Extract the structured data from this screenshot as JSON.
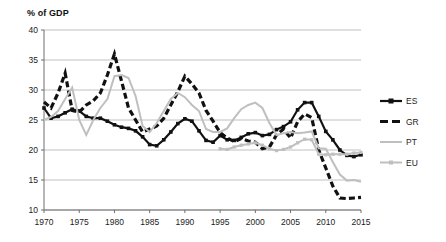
{
  "axis_title": "% of GDP",
  "legend": {
    "position": "right",
    "items": [
      {
        "key": "ES",
        "label": "ES",
        "color": "#111111",
        "style": "solid-marker"
      },
      {
        "key": "GR",
        "label": "GR",
        "color": "#111111",
        "style": "dashed"
      },
      {
        "key": "PT",
        "label": "PT",
        "color": "#bfbfbf",
        "style": "solid"
      },
      {
        "key": "EU",
        "label": "EU",
        "color": "#bfbfbf",
        "style": "solid-marker"
      }
    ]
  },
  "chart_data": {
    "type": "line",
    "title": "",
    "subtitle": "",
    "xlabel": "",
    "ylabel": "% of GDP",
    "xlim": [
      1970,
      2015
    ],
    "ylim": [
      10,
      40
    ],
    "ytick_step": 5,
    "xtick_step": 5,
    "xticks": [
      1970,
      1975,
      1980,
      1985,
      1990,
      1995,
      2000,
      2005,
      2010,
      2015
    ],
    "yticks": [
      10,
      15,
      20,
      25,
      30,
      35,
      40
    ],
    "grid": "horizontal",
    "legend_position": "right",
    "x": [
      1970,
      1971,
      1972,
      1973,
      1974,
      1975,
      1976,
      1977,
      1978,
      1979,
      1980,
      1981,
      1982,
      1983,
      1984,
      1985,
      1986,
      1987,
      1988,
      1989,
      1990,
      1991,
      1992,
      1993,
      1994,
      1995,
      1996,
      1997,
      1998,
      1999,
      2000,
      2001,
      2002,
      2003,
      2004,
      2005,
      2006,
      2007,
      2008,
      2009,
      2010,
      2011,
      2012,
      2013,
      2014,
      2015
    ],
    "series": [
      {
        "name": "ES",
        "label": "ES",
        "color": "#111111",
        "style": "solid",
        "marker": "square",
        "values": [
          27.0,
          25.3,
          25.6,
          26.2,
          26.8,
          26.5,
          25.6,
          25.3,
          25.3,
          24.8,
          24.2,
          23.8,
          23.6,
          23.2,
          22.2,
          20.9,
          20.7,
          21.7,
          23.0,
          24.4,
          25.2,
          24.8,
          23.2,
          21.6,
          21.3,
          22.4,
          21.7,
          21.6,
          22.1,
          22.7,
          22.9,
          22.4,
          22.6,
          23.4,
          23.9,
          24.7,
          26.7,
          27.9,
          27.9,
          25.6,
          23.1,
          21.7,
          20.0,
          19.1,
          18.9,
          19.2
        ]
      },
      {
        "name": "GR",
        "label": "GR",
        "color": "#111111",
        "style": "dashed",
        "marker": "none",
        "values": [
          28.0,
          27.0,
          29.5,
          32.8,
          26.6,
          26.3,
          27.5,
          28.2,
          29.5,
          32.5,
          36.0,
          31.5,
          27.0,
          25.0,
          23.0,
          23.5,
          24.0,
          25.3,
          27.5,
          29.7,
          32.3,
          31.0,
          29.5,
          26.6,
          24.8,
          22.9,
          22.0,
          21.4,
          21.9,
          21.5,
          21.3,
          20.2,
          20.5,
          22.5,
          23.5,
          22.0,
          24.7,
          26.0,
          25.4,
          20.0,
          17.0,
          14.0,
          12.0,
          11.9,
          12.0,
          12.1
        ]
      },
      {
        "name": "PT",
        "label": "PT",
        "color": "#bfbfbf",
        "style": "solid",
        "marker": "none",
        "values": [
          25.0,
          25.5,
          26.5,
          28.5,
          30.4,
          25.0,
          22.5,
          25.0,
          27.0,
          28.5,
          32.3,
          32.5,
          32.0,
          29.0,
          24.0,
          23.0,
          24.5,
          26.5,
          28.5,
          29.5,
          28.8,
          27.5,
          26.5,
          23.5,
          23.0,
          23.0,
          23.6,
          25.3,
          26.8,
          27.5,
          27.9,
          27.0,
          24.5,
          22.5,
          22.8,
          23.0,
          22.8,
          22.9,
          23.1,
          20.3,
          20.2,
          18.0,
          15.9,
          14.9,
          15.0,
          14.7
        ]
      },
      {
        "name": "EU",
        "label": "EU",
        "color": "#bfbfbf",
        "style": "solid",
        "marker": "square",
        "values": [
          null,
          null,
          null,
          null,
          null,
          null,
          null,
          null,
          null,
          null,
          null,
          null,
          null,
          null,
          null,
          null,
          null,
          null,
          null,
          null,
          null,
          null,
          null,
          null,
          null,
          20.2,
          20.1,
          20.5,
          20.8,
          21.0,
          21.2,
          20.8,
          20.2,
          19.9,
          20.1,
          20.5,
          21.2,
          21.8,
          21.7,
          19.3,
          19.2,
          19.3,
          19.3,
          19.3,
          19.5,
          19.6
        ]
      }
    ]
  }
}
